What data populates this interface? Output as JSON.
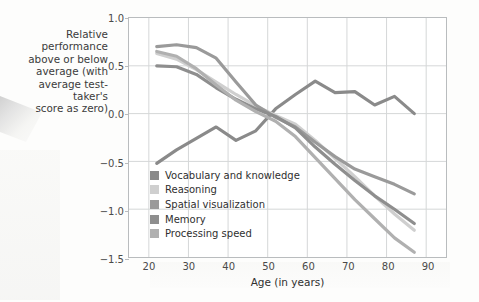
{
  "caption": "Relative performance\nabove or below\naverage (with\naverage test-taker's\nscore as zero)",
  "chart_data": {
    "type": "line",
    "title": "",
    "subtitle": "",
    "xlabel": "Age (in years)",
    "ylabel": "Relative performance above or below average (with average test-taker's score as zero)",
    "xlim": [
      15,
      95
    ],
    "ylim": [
      -1.5,
      1.0
    ],
    "xticks": [
      20,
      30,
      40,
      50,
      60,
      70,
      80,
      90
    ],
    "yticks": [
      1.0,
      0.5,
      0.0,
      -0.5,
      -1.0,
      -1.5
    ],
    "ytick_labels": [
      "1.0",
      "0.5",
      "0.0",
      "−0.5",
      "−1.0",
      "−1.5"
    ],
    "xtick_labels": [
      "20",
      "30",
      "40",
      "50",
      "60",
      "70",
      "80",
      "90"
    ],
    "grid": true,
    "grid_color": "#d5d7d8",
    "legend_position": "inside lower-left",
    "series": [
      {
        "name": "Vocabulary and knowledge",
        "color": "#8a8a8a",
        "x": [
          22,
          27,
          32,
          37,
          42,
          47,
          52,
          57,
          62,
          67,
          72,
          77,
          82,
          87
        ],
        "values": [
          -0.52,
          -0.38,
          -0.26,
          -0.14,
          -0.28,
          -0.18,
          0.05,
          0.2,
          0.34,
          0.22,
          0.23,
          0.09,
          0.18,
          0.0
        ]
      },
      {
        "name": "Reasoning",
        "color": "#cfcfcf",
        "x": [
          22,
          27,
          32,
          37,
          42,
          47,
          52,
          57,
          62,
          67,
          72,
          77,
          82,
          87
        ],
        "values": [
          0.63,
          0.57,
          0.46,
          0.33,
          0.2,
          0.08,
          -0.02,
          -0.11,
          -0.28,
          -0.47,
          -0.66,
          -0.86,
          -1.05,
          -1.22
        ]
      },
      {
        "name": "Spatial visualization",
        "color": "#9a9a9a",
        "x": [
          22,
          27,
          32,
          37,
          42,
          47,
          52,
          57,
          62,
          67,
          72,
          77,
          82,
          87
        ],
        "values": [
          0.7,
          0.72,
          0.69,
          0.58,
          0.33,
          0.09,
          -0.04,
          -0.14,
          -0.3,
          -0.45,
          -0.58,
          -0.66,
          -0.74,
          -0.84
        ]
      },
      {
        "name": "Memory",
        "color": "#8e8e8e",
        "x": [
          22,
          27,
          32,
          37,
          42,
          47,
          52,
          57,
          62,
          67,
          72,
          77,
          82,
          87
        ],
        "values": [
          0.5,
          0.49,
          0.41,
          0.27,
          0.15,
          0.05,
          -0.03,
          -0.15,
          -0.35,
          -0.53,
          -0.7,
          -0.86,
          -1.0,
          -1.15
        ]
      },
      {
        "name": "Processing speed",
        "color": "#b0b0b0",
        "x": [
          22,
          27,
          32,
          37,
          42,
          47,
          52,
          57,
          62,
          67,
          72,
          77,
          82,
          87
        ],
        "values": [
          0.65,
          0.6,
          0.47,
          0.3,
          0.14,
          0.02,
          -0.08,
          -0.24,
          -0.46,
          -0.68,
          -0.9,
          -1.1,
          -1.3,
          -1.45
        ]
      }
    ]
  }
}
